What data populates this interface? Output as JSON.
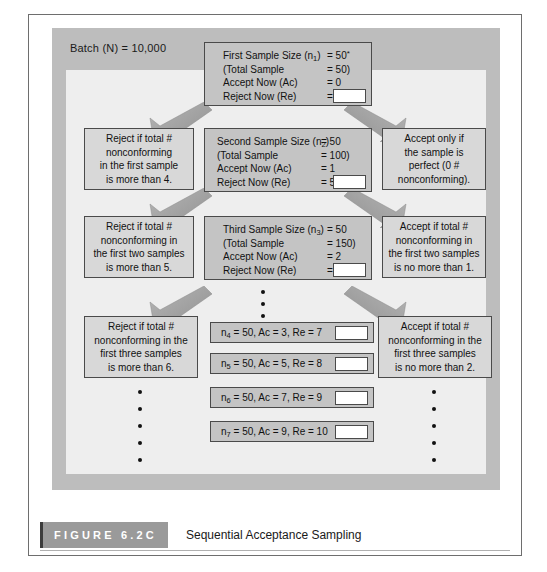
{
  "figure": {
    "number_label": "FIGURE 6.2C",
    "title": "Sequential Acceptance Sampling",
    "batch_label": "Batch (N) = 10,000"
  },
  "stages": [
    {
      "id": "stage-1",
      "rows": [
        {
          "key": "First Sample Size (n",
          "sub": "1",
          "key_tail": ")",
          "value": "= 50",
          "sup": "*"
        },
        {
          "key": "(Total Sample",
          "sub": "",
          "key_tail": "",
          "value": "= 50)",
          "sup": ""
        },
        {
          "key": "Accept Now (Ac)",
          "sub": "",
          "key_tail": "",
          "value": "= 0",
          "sup": ""
        },
        {
          "key": "Reject Now (Re)",
          "sub": "",
          "key_tail": "",
          "value": "= 4",
          "sup": ""
        }
      ]
    },
    {
      "id": "stage-2",
      "rows": [
        {
          "key": "Second Sample Size (n",
          "sub": "2",
          "key_tail": ")",
          "value": "= 50",
          "sup": ""
        },
        {
          "key": "(Total Sample",
          "sub": "",
          "key_tail": "",
          "value": "= 100)",
          "sup": ""
        },
        {
          "key": "Accept Now (Ac)",
          "sub": "",
          "key_tail": "",
          "value": "= 1",
          "sup": ""
        },
        {
          "key": "Reject Now (Re)",
          "sub": "",
          "key_tail": "",
          "value": "= 5",
          "sup": ""
        }
      ]
    },
    {
      "id": "stage-3",
      "rows": [
        {
          "key": "Third Sample Size (n",
          "sub": "3",
          "key_tail": ")",
          "value": "= 50",
          "sup": ""
        },
        {
          "key": "(Total Sample",
          "sub": "",
          "key_tail": "",
          "value": "= 150)",
          "sup": ""
        },
        {
          "key": "Accept Now (Ac)",
          "sub": "",
          "key_tail": "",
          "value": "= 2",
          "sup": ""
        },
        {
          "key": "Reject Now (Re)",
          "sub": "",
          "key_tail": "",
          "value": "= 6",
          "sup": ""
        }
      ]
    }
  ],
  "reject_nodes": [
    {
      "id": "reject-1",
      "lines": [
        "Reject if total #",
        "nonconforming",
        "in the first sample",
        "is more than 4."
      ]
    },
    {
      "id": "reject-2",
      "lines": [
        "Reject if total #",
        "nonconforming in",
        "the first two samples",
        "is more than 5."
      ]
    },
    {
      "id": "reject-3",
      "lines": [
        "Reject if total # ",
        "nonconforming in the",
        "first three samples",
        "is more than 6."
      ]
    }
  ],
  "accept_nodes": [
    {
      "id": "accept-1",
      "lines": [
        "Accept only if",
        "the sample is",
        "perfect (0 #",
        "nonconforming)."
      ]
    },
    {
      "id": "accept-2",
      "lines": [
        "Accept if total #",
        "nonconforming in",
        "the first two samples",
        "is no more than 1."
      ]
    },
    {
      "id": "accept-3",
      "lines": [
        "Accept if total #",
        "nonconforming in the",
        "first three samples",
        "is no more than 2."
      ]
    }
  ],
  "n_rows": [
    {
      "id": "n4",
      "prefix": "n",
      "sub": "4",
      "text": " = 50, Ac = 3, Re = 7"
    },
    {
      "id": "n5",
      "prefix": "n",
      "sub": "5",
      "text": " = 50, Ac = 5, Re = 8"
    },
    {
      "id": "n6",
      "prefix": "n",
      "sub": "6",
      "text": " = 50, Ac = 7, Re = 9"
    },
    {
      "id": "n7",
      "prefix": "n",
      "sub": "7",
      "text": " = 50, Ac = 9, Re = 10"
    }
  ],
  "ellipsis": {
    "center_dots": 3,
    "left_dots": 5,
    "right_dots": 5
  },
  "colors": {
    "panel": "#bdbdbd",
    "field": "#eeeeee",
    "stage_box": "#c4c4c4",
    "side_box": "#d8d8d8",
    "border": "#4a4a4a",
    "caption_tab": "#9a9a9a",
    "text": "#111111"
  }
}
